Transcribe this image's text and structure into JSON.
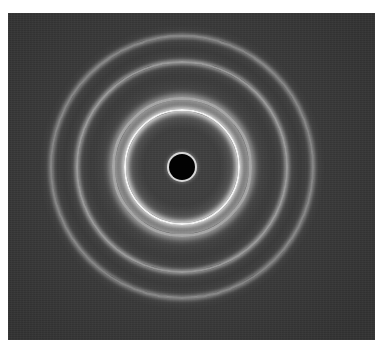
{
  "image": {
    "description": "Electron/X-ray diffraction pattern: concentric rings on a dark background with a central dark beam stop",
    "background_color": "#3a3a3a",
    "ring_color": "#f2f2f2",
    "center": {
      "x": 182,
      "y": 167
    },
    "beam_stop": {
      "radius": 13,
      "fill": "#020202",
      "rim": "#d8d8d8"
    },
    "rings": [
      {
        "name": "inner-bright-ring",
        "radius": 58,
        "width": 8,
        "intensity": 1.0
      },
      {
        "name": "inner-halo-ring",
        "radius": 70,
        "width": 10,
        "intensity": 0.55
      },
      {
        "name": "second-ring",
        "radius": 106,
        "width": 6,
        "intensity": 0.5
      },
      {
        "name": "outer-ring",
        "radius": 132,
        "width": 6,
        "intensity": 0.4
      }
    ]
  }
}
